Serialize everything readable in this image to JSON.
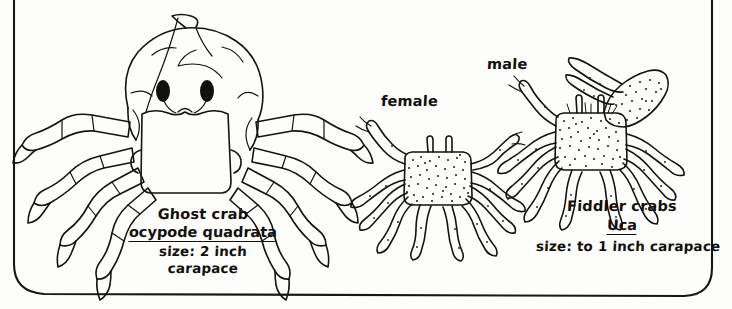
{
  "figure": {
    "style": "hand-drawn ink line drawing in rounded rectangle frame",
    "background_color": "#fdfdfc",
    "ink_color": "#15120f"
  },
  "frame": {
    "name": "rounded-rectangle-border",
    "color": "#1a1713"
  },
  "specimens": [
    {
      "id": "ghost-crab",
      "common_name": "Ghost crab",
      "scientific_name": "ocypode quadrata",
      "scientific_name_underlined": true,
      "size_line_1": "size: 2 inch",
      "size_line_2": "carapace",
      "features": "large smooth carapace, two black eyes on stalks, large square claws held in front, eight segmented walking legs",
      "shading": "outline only, no stippling"
    },
    {
      "id": "fiddler-crabs",
      "common_name": "Fiddler crabs",
      "scientific_name": "Uca",
      "scientific_name_underlined": true,
      "size_line_1": "size: to 1 inch carapace",
      "features": "stippled carapace, small eye stalks, male has one greatly enlarged claw",
      "shading": "stippled / dotted"
    }
  ],
  "callouts": [
    {
      "id": "female-label",
      "text": "female"
    },
    {
      "id": "male-label",
      "text": "male"
    }
  ],
  "labels": {
    "ghost_crab": {
      "common": "Ghost crab",
      "genus": "ocypode",
      "species": "quadrata",
      "size1": "size: 2 inch",
      "size2": "carapace"
    },
    "fiddler": {
      "common": "Fiddler crabs",
      "genus": "Uca",
      "size1": "size: to 1 inch carapace"
    },
    "female": "female",
    "male": "male"
  }
}
